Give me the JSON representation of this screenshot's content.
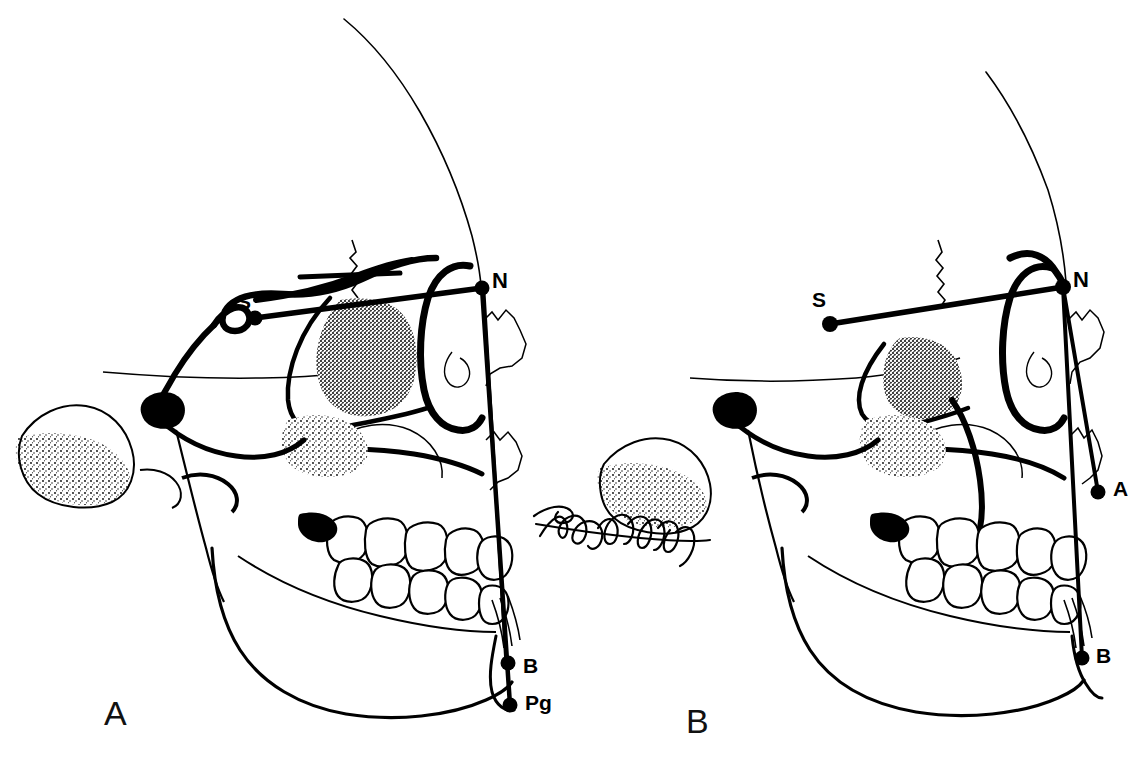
{
  "figure": {
    "type": "line-drawing",
    "background_color": "#ffffff",
    "ink_color": "#000000",
    "panel_count": 2
  },
  "panels": [
    {
      "id": "panel-a",
      "letter": "A",
      "letter_style": "thin sans-serif",
      "description": "Lateral skull profile with sella-nasion reference line and a vertical nasion perpendicular line passing the maxilla, dentition, B point and Pogonion.",
      "landmarks": [
        {
          "code": "S",
          "name": "sella",
          "label": "S",
          "x": 255,
          "y": 318,
          "label_x": 237,
          "label_y": 291
        },
        {
          "code": "N",
          "name": "nasion",
          "label": "N",
          "x": 482,
          "y": 288,
          "label_x": 492,
          "label_y": 270
        },
        {
          "code": "B",
          "name": "b-point",
          "label": "B",
          "x": 508,
          "y": 663,
          "label_x": 523,
          "label_y": 655
        },
        {
          "code": "Pg",
          "name": "pogonion",
          "label": "Pg",
          "x": 510,
          "y": 705,
          "label_x": 525,
          "label_y": 692
        }
      ],
      "reference_lines": [
        {
          "name": "sella-nasion-line",
          "from": "S",
          "to": "N"
        },
        {
          "name": "nasion-vertical-line-outer",
          "from": "N",
          "to": "Pg"
        },
        {
          "name": "nasion-vertical-line-inner",
          "from": "N",
          "to": "B"
        }
      ]
    },
    {
      "id": "panel-b",
      "letter": "B",
      "letter_style": "thin sans-serif",
      "description": "Lateral skull profile with sella-nasion reference line and two lines from nasion to A point and to B point, showing a retruded chin.",
      "landmarks": [
        {
          "code": "S",
          "name": "sella",
          "label": "S",
          "x": 830,
          "y": 324,
          "label_x": 812,
          "label_y": 289
        },
        {
          "code": "N",
          "name": "nasion",
          "label": "N",
          "x": 1063,
          "y": 287,
          "label_x": 1073,
          "label_y": 269
        },
        {
          "code": "A",
          "name": "a-point",
          "label": "A",
          "x": 1098,
          "y": 492,
          "label_x": 1113,
          "label_y": 478
        },
        {
          "code": "B",
          "name": "b-point",
          "label": "B",
          "x": 1082,
          "y": 658,
          "label_x": 1096,
          "label_y": 645
        }
      ],
      "reference_lines": [
        {
          "name": "sella-nasion-line",
          "from": "S",
          "to": "N"
        },
        {
          "name": "nasion-a-point-line",
          "from": "N",
          "to": "A"
        },
        {
          "name": "nasion-b-point-line",
          "from": "N",
          "to": "B"
        }
      ]
    }
  ],
  "annotations": {
    "artist_signature": {
      "name": "artist-signature",
      "style": "handwritten cursive",
      "located_in": "panel-b",
      "position": {
        "x": 540,
        "y": 530
      }
    }
  }
}
